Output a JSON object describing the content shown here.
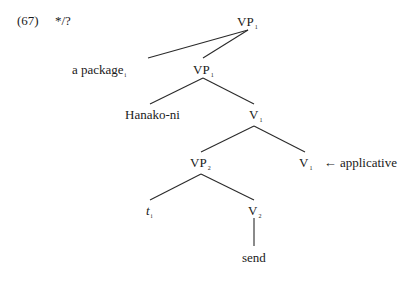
{
  "example": {
    "number": "(67)",
    "judgment": "*/?"
  },
  "tree": {
    "root": {
      "label": "VP",
      "sub": "1"
    },
    "spec": {
      "label": "a package",
      "sub": "i"
    },
    "vp1_bar": {
      "label": "VP",
      "sub": "1"
    },
    "goal": {
      "label": "Hanako-ni"
    },
    "v1_bar": {
      "label": "V",
      "sub": "1"
    },
    "vp2": {
      "label": "VP",
      "sub": "2"
    },
    "v1_head": {
      "label": "V",
      "sub": "1"
    },
    "annotation": {
      "arrow": "←",
      "text": "applicative"
    },
    "trace": {
      "label": "t",
      "sub": "i"
    },
    "v2": {
      "label": "V",
      "sub": "2"
    },
    "verb": {
      "label": "send"
    }
  }
}
